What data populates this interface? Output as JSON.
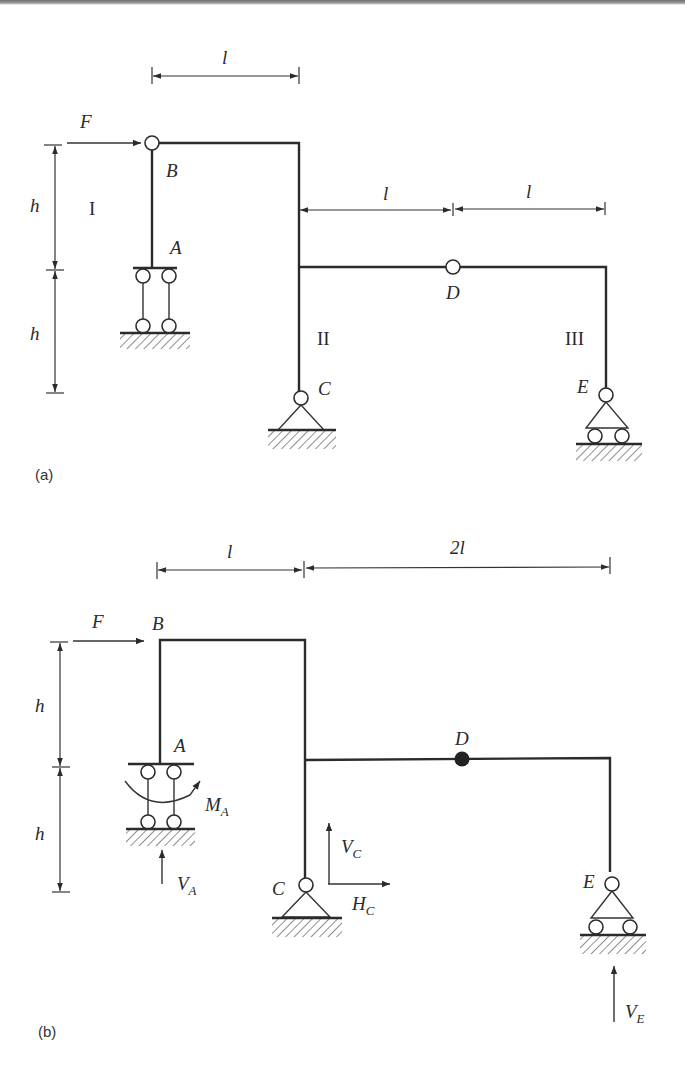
{
  "figure": {
    "a": {
      "caption": "(a)",
      "dimensions": {
        "top_span": "l",
        "mid_left_span": "l",
        "mid_right_span": "l",
        "upper_height": "h",
        "lower_height": "h"
      },
      "load": "F",
      "nodes": {
        "A": "A",
        "B": "B",
        "C": "C",
        "D": "D",
        "E": "E"
      },
      "members": {
        "I": "I",
        "II": "II",
        "III": "III"
      }
    },
    "b": {
      "caption": "(b)",
      "dimensions": {
        "left_span": "l",
        "right_span": "2l",
        "upper_height": "h",
        "lower_height": "h"
      },
      "load": "F",
      "nodes": {
        "A": "A",
        "B": "B",
        "C": "C",
        "D": "D",
        "E": "E"
      },
      "reactions": {
        "MA": {
          "main": "M",
          "sub": "A"
        },
        "VA": {
          "main": "V",
          "sub": "A"
        },
        "VC": {
          "main": "V",
          "sub": "C"
        },
        "HC": {
          "main": "H",
          "sub": "C"
        },
        "VE": {
          "main": "V",
          "sub": "E"
        }
      }
    }
  },
  "colors": {
    "line": "#2b2b2b",
    "background": "#ffffff"
  }
}
